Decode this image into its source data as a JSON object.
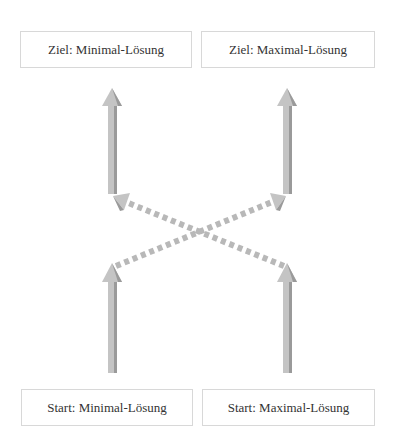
{
  "diagram": {
    "boxes": {
      "goal_min": "Ziel: Minimal-Lösung",
      "goal_max": "Ziel: Maximal-Lösung",
      "start_min": "Start: Minimal-Lösung",
      "start_max": "Start: Maximal-Lösung"
    },
    "colors": {
      "arrow_fill": "#c4c4c4",
      "arrow_shade": "#9a9a9a",
      "box_border": "#d8d8d8",
      "text": "#333333"
    }
  }
}
